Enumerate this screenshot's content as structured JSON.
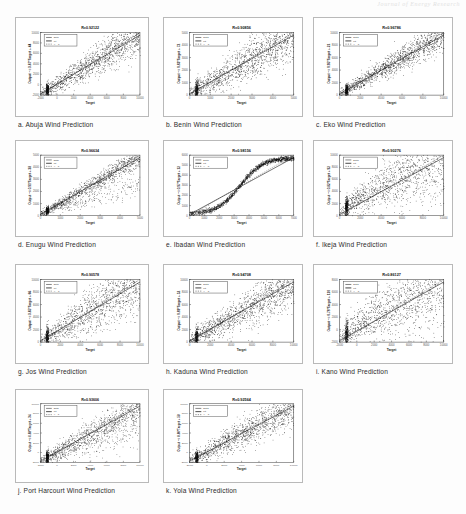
{
  "document": {
    "running_head": "Journal of Energy Research",
    "page_background": "#fdfdfd",
    "figure_type": "regression-scatter-grid",
    "panel_count": 11,
    "columns": 3,
    "rows": 4
  },
  "axis": {
    "xlabel": "Target",
    "legend": {
      "data_label": "Data",
      "fit_label": "Fit",
      "yt_label": "Y = T"
    }
  },
  "panels": [
    {
      "index": "a",
      "caption": "a. Abuja Wind Prediction",
      "city": "Abuja",
      "title": "R=0.92122",
      "r_value": 0.92122,
      "ylabel": "Output ~= 0.87*Target + 44",
      "xticks": [
        "-2000",
        "0",
        "2000",
        "4000",
        "6000",
        "8000",
        "10000"
      ],
      "yticks": [
        "-2000",
        "0",
        "2000",
        "4000",
        "6000",
        "8000",
        "10000"
      ],
      "shape": "linear",
      "spread": 0.16,
      "slope": 0.87,
      "dense_column": true
    },
    {
      "index": "b",
      "caption": "b. Benin Wind Prediction",
      "city": "Benin",
      "title": "R=0.90856",
      "r_value": 0.90856,
      "ylabel": "Output ~= 0.83*Target + 72",
      "xticks": [
        "0",
        "1000",
        "2000",
        "3000",
        "4000",
        "5000"
      ],
      "yticks": [
        "0",
        "1000",
        "2000",
        "3000",
        "4000",
        "5000"
      ],
      "shape": "linear",
      "spread": 0.21,
      "slope": 0.83,
      "dense_column": true
    },
    {
      "index": "c",
      "caption": "c. Eko Wind Prediction",
      "city": "Eko",
      "title": "R=0.96786",
      "r_value": 0.96786,
      "ylabel": "Output ~= 0.95*Target + 21",
      "xticks": [
        "0",
        "2000",
        "4000",
        "6000",
        "8000",
        "10000"
      ],
      "yticks": [
        "0",
        "2000",
        "4000",
        "6000",
        "8000",
        "10000"
      ],
      "shape": "linear",
      "spread": 0.13,
      "slope": 0.95,
      "dense_column": true
    },
    {
      "index": "d",
      "caption": "d. Enugu Wind Prediction",
      "city": "Enugu",
      "title": "R=0.96634",
      "r_value": 0.96634,
      "ylabel": "Output ~= 0.91*Target + 38",
      "xticks": [
        "0",
        "1000",
        "2000",
        "3000",
        "4000",
        "5000"
      ],
      "yticks": [
        "0",
        "1000",
        "2000",
        "3000",
        "4000",
        "5000"
      ],
      "shape": "bifurcated",
      "spread": 0.1,
      "slope": 0.91,
      "dense_column": true
    },
    {
      "index": "e",
      "caption": "e. Ibadan Wind Prediction",
      "city": "Ibadan",
      "title": "R=0.98156",
      "r_value": 0.98156,
      "ylabel": "Output ~= 0.97*Target + 12",
      "xticks": [
        "0",
        "1000",
        "2000",
        "3000",
        "4000",
        "5000",
        "6000",
        "7000"
      ],
      "yticks": [
        "0",
        "1000",
        "2000",
        "3000",
        "4000",
        "5000",
        "6000"
      ],
      "shape": "sigmoid",
      "spread": 0.07,
      "slope": 0.97,
      "dense_column": false
    },
    {
      "index": "f",
      "caption": "f. Ikeja Wind Prediction",
      "city": "Ikeja",
      "title": "R=0.90276",
      "r_value": 0.90276,
      "ylabel": "Output ~= 0.82*Target + 92",
      "xticks": [
        "0",
        "2000",
        "4000",
        "6000",
        "8000",
        "10000"
      ],
      "yticks": [
        "0",
        "2000",
        "4000",
        "6000",
        "8000",
        "10000"
      ],
      "shape": "fan",
      "spread": 0.26,
      "slope": 0.82,
      "dense_column": true
    },
    {
      "index": "g",
      "caption": "g. Jos Wind Prediction",
      "city": "Jos",
      "title": "R=0.90578",
      "r_value": 0.90578,
      "ylabel": "Output ~= 0.85*Target + 66",
      "xticks": [
        "0",
        "2000",
        "4000",
        "6000",
        "8000",
        "10000"
      ],
      "yticks": [
        "0",
        "2000",
        "4000",
        "6000",
        "8000",
        "10000"
      ],
      "shape": "linear",
      "spread": 0.24,
      "slope": 0.85,
      "dense_column": true
    },
    {
      "index": "h",
      "caption": "h. Kaduna Wind Prediction",
      "city": "Kaduna",
      "title": "R=0.94708",
      "r_value": 0.94708,
      "ylabel": "Output ~= 0.89*Target + 52",
      "xticks": [
        "0",
        "2000",
        "4000",
        "6000",
        "8000",
        "10000"
      ],
      "yticks": [
        "0",
        "2000",
        "4000",
        "6000",
        "8000",
        "10000"
      ],
      "shape": "linear",
      "spread": 0.2,
      "slope": 0.89,
      "dense_column": true
    },
    {
      "index": "i",
      "caption": "i. Kano Wind Prediction",
      "city": "Kano",
      "title": "R=0.86127",
      "r_value": 0.86127,
      "ylabel": "Output ~= 0.78*Target + 110",
      "xticks": [
        "-2000",
        "0",
        "2000",
        "4000",
        "6000",
        "8000",
        "10000"
      ],
      "yticks": [
        "-2000",
        "0",
        "2000",
        "4000",
        "6000",
        "8000"
      ],
      "shape": "fan",
      "spread": 0.3,
      "slope": 0.78,
      "dense_column": true
    },
    {
      "index": "j",
      "caption": "j. Port Harcourt Wind Prediction",
      "city": "Port Harcourt",
      "title": "R=0.93606",
      "r_value": 0.93606,
      "ylabel": "Output ~= 0.88*Target + 34",
      "xticks": [
        "-2000",
        "0",
        "2000",
        "4000",
        "6000",
        "8000",
        "10000"
      ],
      "yticks": [
        "-2000",
        "0",
        "2000",
        "4000",
        "6000",
        "8000",
        "10000"
      ],
      "shape": "bifurcated",
      "spread": 0.17,
      "slope": 0.88,
      "dense_column": true
    },
    {
      "index": "k",
      "caption": "k. Yola Wind Prediction",
      "city": "Yola",
      "title": "R=0.92564",
      "r_value": 0.92564,
      "ylabel": "Output ~= 0.86*Target + 58",
      "xticks": [
        "-2000",
        "0",
        "2000",
        "4000",
        "6000",
        "8000",
        "10000"
      ],
      "yticks": [
        "-2000",
        "0",
        "2000",
        "4000",
        "6000",
        "8000",
        "10000"
      ],
      "shape": "linear",
      "spread": 0.18,
      "slope": 0.86,
      "dense_column": true
    }
  ],
  "chart_data": {
    "type": "scatter",
    "xlabel": "Target",
    "ylabel": "Output",
    "grid": false,
    "legend_position": "top-left",
    "series": [
      {
        "name": "Abuja",
        "r": 0.92122,
        "slope": 0.87,
        "intercept": 44,
        "shape": "linear"
      },
      {
        "name": "Benin",
        "r": 0.90856,
        "slope": 0.83,
        "intercept": 72,
        "shape": "linear"
      },
      {
        "name": "Eko",
        "r": 0.96786,
        "slope": 0.95,
        "intercept": 21,
        "shape": "linear"
      },
      {
        "name": "Enugu",
        "r": 0.96634,
        "slope": 0.91,
        "intercept": 38,
        "shape": "bifurcated"
      },
      {
        "name": "Ibadan",
        "r": 0.98156,
        "slope": 0.97,
        "intercept": 12,
        "shape": "sigmoid"
      },
      {
        "name": "Ikeja",
        "r": 0.90276,
        "slope": 0.82,
        "intercept": 92,
        "shape": "fan"
      },
      {
        "name": "Jos",
        "r": 0.90578,
        "slope": 0.85,
        "intercept": 66,
        "shape": "linear"
      },
      {
        "name": "Kaduna",
        "r": 0.94708,
        "slope": 0.89,
        "intercept": 52,
        "shape": "linear"
      },
      {
        "name": "Kano",
        "r": 0.86127,
        "slope": 0.78,
        "intercept": 110,
        "shape": "fan"
      },
      {
        "name": "Port Harcourt",
        "r": 0.93606,
        "slope": 0.88,
        "intercept": 34,
        "shape": "bifurcated"
      },
      {
        "name": "Yola",
        "r": 0.92564,
        "slope": 0.86,
        "intercept": 58,
        "shape": "linear"
      }
    ]
  }
}
